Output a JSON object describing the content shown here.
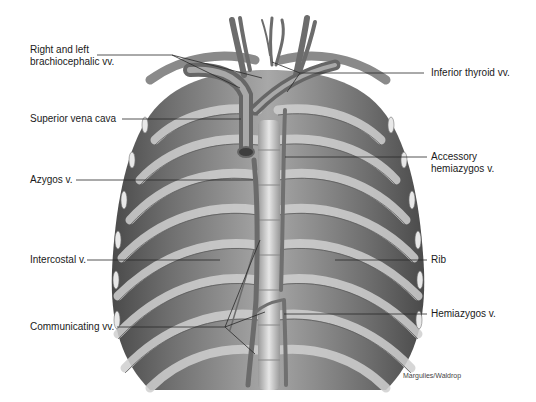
{
  "figure": {
    "credit": "Margulies/Waldrop"
  },
  "labels": {
    "left": [
      {
        "id": "brachiocephalic",
        "line1": "Right and left",
        "line2": "brachiocephalic vv."
      },
      {
        "id": "svc",
        "line1": "Superior vena cava"
      },
      {
        "id": "azygos",
        "line1": "Azygos v."
      },
      {
        "id": "intercostal",
        "line1": "Intercostal v."
      },
      {
        "id": "communicating",
        "line1": "Communicating vv."
      }
    ],
    "right": [
      {
        "id": "inferior-thyroid",
        "line1": "Inferior thyroid vv."
      },
      {
        "id": "accessory-hemiazygos",
        "line1": "Accessory",
        "line2": "hemiazygos v."
      },
      {
        "id": "rib",
        "line1": "Rib"
      },
      {
        "id": "hemiazygos",
        "line1": "Hemiazygos v."
      }
    ]
  },
  "colors": {
    "background": "#ffffff",
    "text": "#1a1a1a",
    "leader": "#2a2a2a",
    "wall_dark": "#5e5e5e",
    "wall_mid": "#8c8c8c",
    "rib_light": "#c9c9c9",
    "vessel": "#7a7a7a",
    "vessel_light": "#d8d8d8"
  }
}
